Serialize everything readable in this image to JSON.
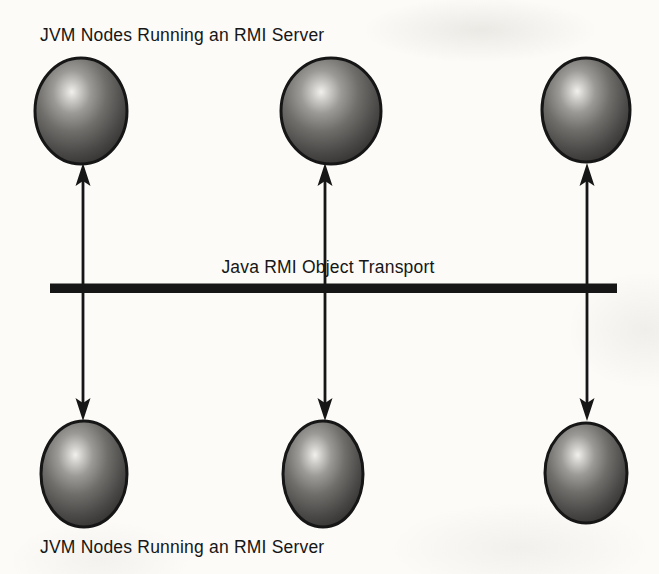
{
  "colors": {
    "ink": "#161616",
    "paper": "#fcfbf8",
    "sphere_highlight": "#f1f0ed",
    "sphere_light": "#b5b4b0",
    "sphere_mid": "#6f6e6b",
    "sphere_dark": "#3b3a38",
    "sphere_rim": "#232322"
  },
  "diagram": {
    "top_caption": "JVM Nodes Running an RMI Server",
    "bottom_caption": "JVM Nodes Running an RMI Server",
    "bus": {
      "label": "Java RMI Object Transport"
    },
    "nodes": [
      {
        "id": "jvm-node-top-1",
        "row": "top",
        "col": 1,
        "icon": "sphere-icon"
      },
      {
        "id": "jvm-node-top-2",
        "row": "top",
        "col": 2,
        "icon": "sphere-icon"
      },
      {
        "id": "jvm-node-top-3",
        "row": "top",
        "col": 3,
        "icon": "sphere-icon"
      },
      {
        "id": "jvm-node-bottom-1",
        "row": "bottom",
        "col": 1,
        "icon": "sphere-icon"
      },
      {
        "id": "jvm-node-bottom-2",
        "row": "bottom",
        "col": 2,
        "icon": "sphere-icon"
      },
      {
        "id": "jvm-node-bottom-3",
        "row": "bottom",
        "col": 3,
        "icon": "sphere-icon"
      }
    ],
    "connectors": [
      {
        "id": "rmi-link-1",
        "type": "double-arrow"
      },
      {
        "id": "rmi-link-2",
        "type": "double-arrow"
      },
      {
        "id": "rmi-link-3",
        "type": "double-arrow"
      }
    ]
  }
}
